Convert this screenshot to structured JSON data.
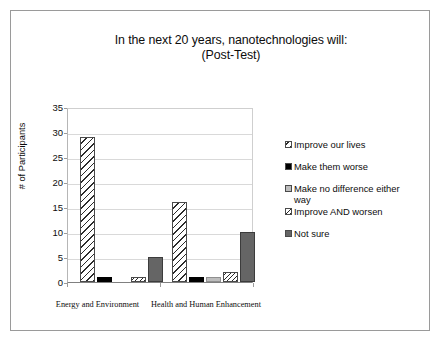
{
  "chart_data": {
    "type": "bar",
    "title": "In the next 20 years, nanotechnologies will:",
    "subtitle": "(Post-Test)",
    "xlabel": "",
    "ylabel": "# of Participants",
    "ylim": [
      0,
      35
    ],
    "yticks": [
      0,
      5,
      10,
      15,
      20,
      25,
      30,
      35
    ],
    "grid": true,
    "legend_position": "right",
    "categories": [
      "Energy and Environment",
      "Health and Human Enhancement"
    ],
    "series": [
      {
        "name": "Improve our lives",
        "values": [
          29,
          16
        ],
        "pattern": "diagonal-hatch-wide",
        "color": "#ffffff"
      },
      {
        "name": "Make them worse",
        "values": [
          1,
          1
        ],
        "pattern": "solid",
        "color": "#000000"
      },
      {
        "name": "Make no difference either way",
        "values": [
          0,
          1
        ],
        "pattern": "solid",
        "color": "#bdbdbd"
      },
      {
        "name": "Improve AND worsen",
        "values": [
          1,
          2
        ],
        "pattern": "diagonal-hatch-narrow",
        "color": "#ffffff"
      },
      {
        "name": "Not sure",
        "values": [
          5,
          10
        ],
        "pattern": "solid",
        "color": "#656565"
      }
    ]
  },
  "legend": {
    "items": [
      "Improve our lives",
      "Make them worse",
      "Make no difference either\nway",
      "Improve AND worsen",
      "Not sure"
    ]
  },
  "axes": {
    "y_title": "# of Participants",
    "y_ticks": [
      "35",
      "30",
      "25",
      "20",
      "15",
      "10",
      "5",
      "0"
    ],
    "x_ticks": [
      "Energy and Environment",
      "Health and Human Enhancement"
    ]
  }
}
